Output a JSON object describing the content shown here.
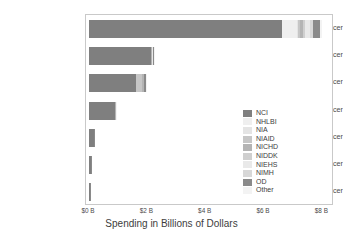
{
  "chart_data": {
    "type": "bar",
    "orientation": "horizontal",
    "stacked": true,
    "title": "",
    "xlabel": "Spending in Billions of Dollars",
    "ylabel": "",
    "xlim": [
      0,
      8.4
    ],
    "xticks": [
      0,
      2,
      4,
      6,
      8
    ],
    "xtick_labels": [
      "$0 B",
      "$2 B",
      "$4 B",
      "$6 B",
      "$8 B"
    ],
    "grid": false,
    "legend_position": "center right",
    "categories": [
      "Breast Cancer",
      "Ovarian Cancer",
      "Cervical Cancer",
      "Endometrial Cancer",
      "Uterine Cancer",
      "Vaginal Cancer",
      "Vulvar Cancer"
    ],
    "series": [
      {
        "name": "NCI",
        "color": "#7f7f7f",
        "values": [
          6.6,
          2.13,
          1.62,
          0.9,
          0.16,
          0.055,
          0.028
        ]
      },
      {
        "name": "NHLBI",
        "color": "#efefef",
        "values": [
          0.52,
          0.0,
          0.0,
          0.0,
          0.0,
          0.0,
          0.0
        ]
      },
      {
        "name": "NIA",
        "color": "#e4e4e4",
        "values": [
          0.06,
          0.0,
          0.0,
          0.0,
          0.0,
          0.0,
          0.0
        ]
      },
      {
        "name": "NIAID",
        "color": "#c6c6c6",
        "values": [
          0.04,
          0.0,
          0.21,
          0.0,
          0.0,
          0.0,
          0.0
        ]
      },
      {
        "name": "NICHD",
        "color": "#b4b4b4",
        "values": [
          0.12,
          0.04,
          0.06,
          0.01,
          0.0,
          0.0,
          0.0
        ]
      },
      {
        "name": "NIDDK",
        "color": "#cfcfcf",
        "values": [
          0.05,
          0.0,
          0.0,
          0.0,
          0.0,
          0.0,
          0.0
        ]
      },
      {
        "name": "NIEHS",
        "color": "#e9e9e9",
        "values": [
          0.2,
          0.02,
          0.01,
          0.01,
          0.0,
          0.0,
          0.0
        ]
      },
      {
        "name": "NIMH",
        "color": "#d8d8d8",
        "values": [
          0.08,
          0.0,
          0.0,
          0.0,
          0.0,
          0.0,
          0.0
        ]
      },
      {
        "name": "OD",
        "color": "#8a8a8a",
        "values": [
          0.25,
          0.05,
          0.04,
          0.02,
          0.01,
          0.003,
          0.002
        ]
      },
      {
        "name": "Other",
        "color": "#f3f3f3",
        "values": [
          0.08,
          0.01,
          0.01,
          0.01,
          0.0,
          0.0,
          0.0
        ]
      }
    ],
    "totals": [
      8.0,
      2.25,
      1.95,
      0.95,
      0.17,
      0.058,
      0.03
    ]
  },
  "legend": {
    "items": [
      {
        "label": "NCI"
      },
      {
        "label": "NHLBI"
      },
      {
        "label": "NIA"
      },
      {
        "label": "NIAID"
      },
      {
        "label": "NICHD"
      },
      {
        "label": "NIDDK"
      },
      {
        "label": "NIEHS"
      },
      {
        "label": "NIMH"
      },
      {
        "label": "OD"
      },
      {
        "label": "Other"
      }
    ]
  }
}
